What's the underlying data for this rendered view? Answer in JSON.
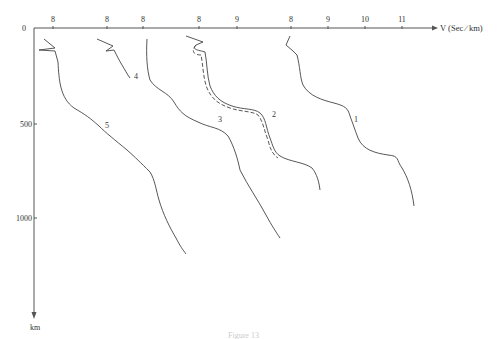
{
  "chart_data": {
    "type": "line",
    "title": "",
    "xlabel": "V (Sec ∕ km)",
    "ylabel": "km",
    "x_tick_labels": [
      "8",
      "8",
      "8",
      "8",
      "9",
      "8",
      "9",
      "10",
      "11"
    ],
    "y_tick_labels": [
      "0",
      "500",
      "1000"
    ],
    "y_unit": "km",
    "ylim": [
      0,
      1450
    ],
    "grid": false,
    "legend": "curves labeled inline 1–5",
    "note": "Five offset velocity-depth profiles; each curve has its own x origin at one of the '8' ticks. Curve 2 has an additional dashed companion profile.",
    "series": [
      {
        "name": "1",
        "x_origin_tick": "8 (right group)",
        "depth_km": [
          0,
          100,
          300,
          420,
          500,
          650,
          700,
          900
        ],
        "velocity": [
          8.0,
          8.1,
          8.4,
          9.3,
          9.5,
          10.0,
          11.0,
          11.3
        ]
      },
      {
        "name": "2",
        "x_origin_tick": "8 (fourth)",
        "depth_km": [
          0,
          100,
          300,
          400,
          450,
          600,
          700,
          850
        ],
        "velocity": [
          8.0,
          8.1,
          8.3,
          8.9,
          9.1,
          9.3,
          9.9,
          10.1
        ]
      },
      {
        "name": "2 (dashed)",
        "x_origin_tick": "8 (fourth)",
        "depth_km": [
          0,
          100,
          300,
          400,
          450,
          600,
          700
        ],
        "velocity": [
          8.0,
          8.05,
          8.3,
          8.85,
          9.05,
          9.25,
          9.85
        ]
      },
      {
        "name": "3",
        "x_origin_tick": "8 (third)",
        "depth_km": [
          0,
          200,
          350,
          500,
          700,
          1100
        ],
        "velocity": [
          8.0,
          8.1,
          8.7,
          9.1,
          9.6,
          10.2
        ]
      },
      {
        "name": "4",
        "x_origin_tick": "8 (second)",
        "depth_km": [
          0,
          100,
          200,
          250
        ],
        "velocity": [
          7.9,
          8.2,
          8.5,
          8.8
        ]
      },
      {
        "name": "5",
        "x_origin_tick": "8 (first)",
        "depth_km": [
          0,
          150,
          250,
          400,
          500,
          700,
          900,
          1200
        ],
        "velocity": [
          7.8,
          8.0,
          8.2,
          8.4,
          9.0,
          9.7,
          10.1,
          10.4
        ]
      }
    ]
  },
  "axis": {
    "origin_label": "0",
    "x_ticks": [
      {
        "label": "8",
        "x": 53
      },
      {
        "label": "8",
        "x": 107
      },
      {
        "label": "8",
        "x": 143
      },
      {
        "label": "8",
        "x": 199
      },
      {
        "label": "9",
        "x": 237
      },
      {
        "label": "8",
        "x": 291
      },
      {
        "label": "9",
        "x": 328
      },
      {
        "label": "10",
        "x": 365
      },
      {
        "label": "11",
        "x": 402
      }
    ],
    "y_ticks": [
      {
        "label": "500",
        "y": 124
      },
      {
        "label": "1000",
        "y": 218
      }
    ],
    "x_title": "V (Sec ∕ km)",
    "y_title": "km"
  },
  "curve_labels": [
    {
      "label": "1",
      "x": 354,
      "y": 122
    },
    {
      "label": "2",
      "x": 272,
      "y": 117
    },
    {
      "label": "3",
      "x": 218,
      "y": 122
    },
    {
      "label": "4",
      "x": 134,
      "y": 79
    },
    {
      "label": "5",
      "x": 105,
      "y": 128
    }
  ],
  "caption": "Figure 13"
}
